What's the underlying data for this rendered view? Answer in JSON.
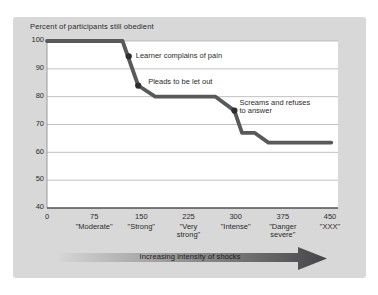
{
  "panel": {
    "background": "#d8d8d8"
  },
  "chart_data": {
    "type": "line",
    "title": "Percent of participants still obedient",
    "x_axis": {
      "min": 0,
      "max": 450,
      "ticks": [
        {
          "value": 0,
          "name_lines": []
        },
        {
          "value": 75,
          "name_lines": [
            "\"Moderate\""
          ]
        },
        {
          "value": 150,
          "name_lines": [
            "\"Strong\""
          ]
        },
        {
          "value": 225,
          "name_lines": [
            "\"Very",
            "strong\""
          ]
        },
        {
          "value": 300,
          "name_lines": [
            "\"Intense\""
          ]
        },
        {
          "value": 375,
          "name_lines": [
            "\"Danger",
            "severe\""
          ]
        },
        {
          "value": 450,
          "name_lines": [
            "\"XXX\""
          ]
        }
      ]
    },
    "y_axis": {
      "min": 40,
      "max": 100,
      "tick_step": 10,
      "tick_labels": [
        "40",
        "50",
        "60",
        "70",
        "80",
        "90",
        "100"
      ]
    },
    "grid": true,
    "plot_background": "#ffffff",
    "gridline_color": "#b0b0b0",
    "left_axis_color": "#9a9a9a",
    "bottom_axis_color": "#505052",
    "series": [
      {
        "name": "percent-still-obedient",
        "color": "#58595b",
        "points": [
          [
            0,
            100
          ],
          [
            120,
            100
          ],
          [
            145,
            84
          ],
          [
            172,
            80
          ],
          [
            268,
            80
          ],
          [
            298,
            75
          ],
          [
            310,
            67
          ],
          [
            330,
            67
          ],
          [
            352,
            63.5
          ],
          [
            452,
            63.5
          ]
        ]
      }
    ],
    "annotations": [
      {
        "lines": [
          "Learner complains of pain"
        ],
        "x": 130,
        "y": 94.5,
        "dx": 7,
        "dy": -4.5
      },
      {
        "lines": [
          "Pleads to be let out"
        ],
        "x": 145,
        "y": 84,
        "dx": 10,
        "dy": -8
      },
      {
        "lines": [
          "Screams and refuses",
          "to answer"
        ],
        "x": 298,
        "y": 75,
        "dx": 5,
        "dy": -11.5
      }
    ],
    "dot_color": "#2e2e30"
  },
  "footer_arrow": {
    "label": "Increasing intensity of shocks",
    "gradient_start": "#d6d6d6",
    "gradient_end": "#454547",
    "text_color": "#1c1c1c"
  }
}
